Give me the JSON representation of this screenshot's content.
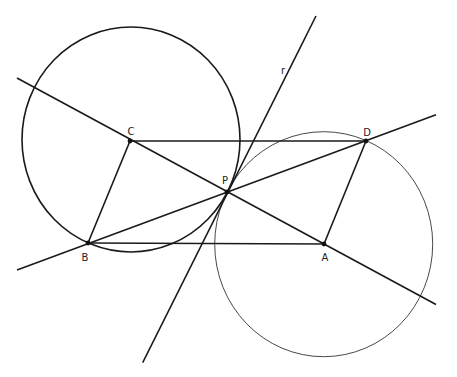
{
  "diagram": {
    "points": {
      "A": {
        "label": "A",
        "x": 324,
        "y": 244
      },
      "B": {
        "label": "B",
        "x": 88,
        "y": 243
      },
      "C": {
        "label": "C",
        "x": 130,
        "y": 141
      },
      "D": {
        "label": "D",
        "x": 366,
        "y": 141
      },
      "P": {
        "label": "P",
        "x": 227,
        "y": 192
      }
    },
    "line_label": "r",
    "colors": {
      "stroke": "#1a1a1a",
      "thin_stroke": "#333333",
      "background": "#ffffff"
    }
  }
}
